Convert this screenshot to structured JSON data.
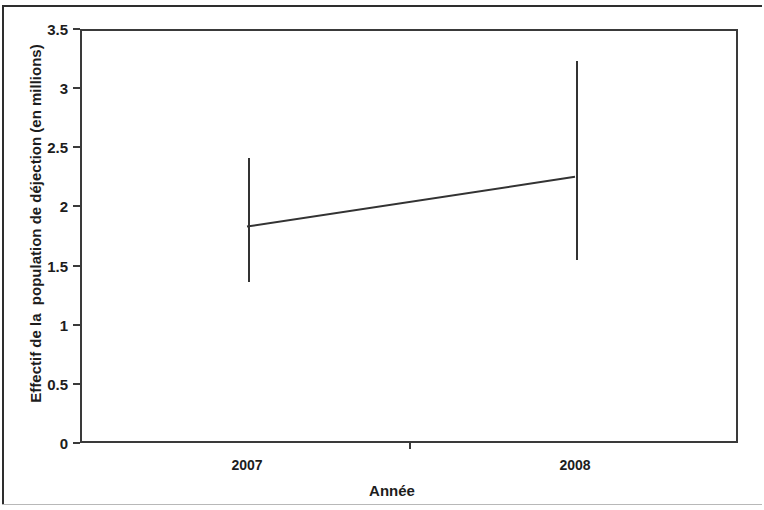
{
  "figure": {
    "axis_title_x": "Année",
    "axis_title_y": "Effectif de la  population de déjection (en millions)"
  },
  "chart_data": {
    "type": "line",
    "title": "",
    "subtitle": "",
    "xlabel": "Année",
    "ylabel": "Effectif de la  population de déjection (en millions)",
    "categories": [
      "2007",
      "2008"
    ],
    "series": [
      {
        "name": "Effectif de la population de déjection",
        "values": [
          1.83,
          2.25
        ],
        "error_upper": [
          2.43,
          3.25
        ],
        "error_lower": [
          1.38,
          1.56
        ]
      }
    ],
    "ylim": [
      0,
      3.5
    ],
    "ytick_labels": [
      "0",
      "0.5",
      "1",
      "1.5",
      "2",
      "2.5",
      "3",
      "3.5"
    ],
    "ytick_values": [
      0,
      0.5,
      1,
      1.5,
      2,
      2.5,
      3,
      3.5
    ],
    "xtick_labels": [
      "2007",
      "2008"
    ],
    "grid": false,
    "legend": false,
    "legend_position": "none",
    "error_bar_style": "plain-vertical-line",
    "line_color": "#333333",
    "axis_color": "#3a3a3a",
    "background_color": "#ffffff"
  }
}
